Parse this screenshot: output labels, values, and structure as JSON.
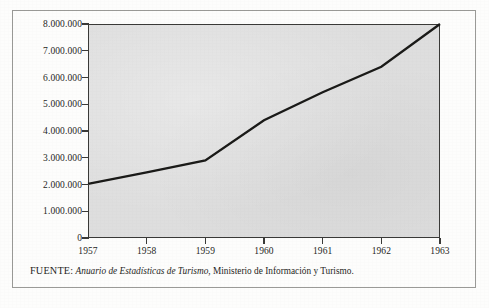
{
  "figure": {
    "source_label": "FUENTE:",
    "source_title": "Anuario de Estadísticas de Turismo",
    "source_rest": ", Ministerio de Información y Turismo."
  },
  "chart_data": {
    "type": "line",
    "title": "",
    "subtitle": "",
    "xlabel": "",
    "ylabel": "",
    "x": [
      1957,
      1958,
      1959,
      1960,
      1961,
      1962,
      1963
    ],
    "categories": [
      "1957",
      "1958",
      "1959",
      "1960",
      "1961",
      "1962",
      "1963"
    ],
    "values": [
      2020000,
      2450000,
      2900000,
      4400000,
      5450000,
      6400000,
      8000000
    ],
    "series": [
      {
        "name": "Viajeros",
        "values": [
          2020000,
          2450000,
          2900000,
          4400000,
          5450000,
          6400000,
          8000000
        ]
      }
    ],
    "xlim": [
      1957,
      1963
    ],
    "ylim": [
      0,
      8000000
    ],
    "ytick_values": [
      0,
      1000000,
      2000000,
      3000000,
      4000000,
      5000000,
      6000000,
      7000000,
      8000000
    ],
    "ytick_labels": [
      "0",
      "1.000.000",
      "2.000.000",
      "3.000.000",
      "4.000.000",
      "5.000.000",
      "6.000.000",
      "7.000.000",
      "8.000.000"
    ],
    "xtick_labels": [
      "1957",
      "1958",
      "1959",
      "1960",
      "1961",
      "1962",
      "1963"
    ],
    "grid": false,
    "legend": false,
    "legend_position": "none",
    "line_color": "#1a1a18",
    "plot_background": "#dedede",
    "axis_color": "#3a3a38"
  }
}
